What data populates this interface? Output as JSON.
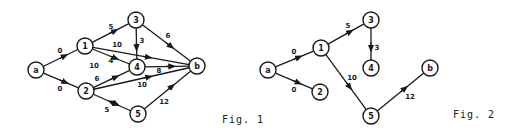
{
  "figures": [
    {
      "id": "fig1",
      "caption": "Fig. 1",
      "caption_pos": [
        222,
        114
      ],
      "nodes": [
        {
          "id": "a",
          "label": "a",
          "x": 36,
          "y": 70
        },
        {
          "id": "1",
          "label": "1",
          "x": 85,
          "y": 46
        },
        {
          "id": "2",
          "label": "2",
          "x": 86,
          "y": 91
        },
        {
          "id": "3",
          "label": "3",
          "x": 136,
          "y": 20
        },
        {
          "id": "4",
          "label": "4",
          "x": 137,
          "y": 67
        },
        {
          "id": "5",
          "label": "5",
          "x": 138,
          "y": 114
        },
        {
          "id": "b",
          "label": "b",
          "x": 197,
          "y": 66
        }
      ],
      "edges": [
        {
          "from": "a",
          "to": "1",
          "weight": "0",
          "lx": 60,
          "ly": 51
        },
        {
          "from": "a",
          "to": "2",
          "weight": "0",
          "lx": 60,
          "ly": 89
        },
        {
          "from": "1",
          "to": "3",
          "weight": "5",
          "lx": 111,
          "ly": 27
        },
        {
          "from": "1",
          "to": "4",
          "weight": "4",
          "lx": 111,
          "ly": 61
        },
        {
          "from": "1",
          "to": "b",
          "weight": "10",
          "lx": 117,
          "ly": 45
        },
        {
          "from": "2",
          "to": "5",
          "weight": "10",
          "lx": 94,
          "ly": 66,
          "reverse_arrow": true
        },
        {
          "from": "2",
          "to": "4",
          "weight": "6",
          "lx": 97,
          "ly": 79
        },
        {
          "from": "2",
          "to": "b",
          "weight": "10",
          "lx": 142,
          "ly": 85
        },
        {
          "from": "2",
          "to": "5",
          "weight": "5",
          "lx": 107,
          "ly": 110,
          "skip_line_curve": false
        },
        {
          "from": "3",
          "to": "4",
          "weight": "3",
          "lx": 142,
          "ly": 41
        },
        {
          "from": "3",
          "to": "b",
          "weight": "6",
          "lx": 168,
          "ly": 36
        },
        {
          "from": "4",
          "to": "b",
          "weight": "8",
          "lx": 159,
          "ly": 71
        },
        {
          "from": "5",
          "to": "b",
          "weight": "12",
          "lx": 164,
          "ly": 102
        }
      ]
    },
    {
      "id": "fig2",
      "caption": "Fig. 2",
      "caption_pos": [
        453,
        109
      ],
      "nodes": [
        {
          "id": "a",
          "label": "a",
          "x": 268,
          "y": 70
        },
        {
          "id": "1",
          "label": "1",
          "x": 321,
          "y": 48
        },
        {
          "id": "2",
          "label": "2",
          "x": 320,
          "y": 92
        },
        {
          "id": "3",
          "label": "3",
          "x": 371,
          "y": 20
        },
        {
          "id": "4",
          "label": "4",
          "x": 371,
          "y": 68
        },
        {
          "id": "5",
          "label": "5",
          "x": 371,
          "y": 116
        },
        {
          "id": "b",
          "label": "b",
          "x": 430,
          "y": 68
        }
      ],
      "edges": [
        {
          "from": "a",
          "to": "1",
          "weight": "0",
          "lx": 294,
          "ly": 52
        },
        {
          "from": "a",
          "to": "2",
          "weight": "0",
          "lx": 294,
          "ly": 90
        },
        {
          "from": "1",
          "to": "3",
          "weight": "5",
          "lx": 348,
          "ly": 26
        },
        {
          "from": "3",
          "to": "4",
          "weight": "3",
          "lx": 377,
          "ly": 48
        },
        {
          "from": "1",
          "to": "5",
          "weight": "10",
          "lx": 352,
          "ly": 78
        },
        {
          "from": "5",
          "to": "b",
          "weight": "12",
          "lx": 410,
          "ly": 97
        }
      ]
    }
  ]
}
